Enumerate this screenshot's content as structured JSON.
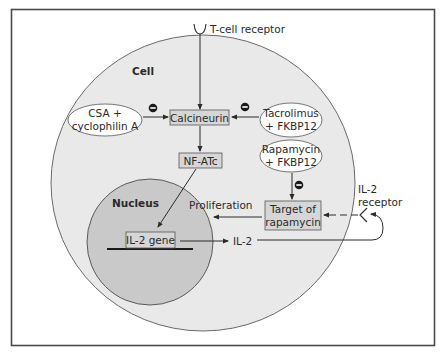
{
  "diagram": {
    "colors": {
      "background": "#ffffff",
      "frame": "#4a4a4a",
      "cell_fill": "#e9e9e9",
      "nucleus_fill": "#c9c9c9",
      "box_fill": "#d6d6d6",
      "ellipse_fill": "#ffffff",
      "line": "#2a2a2a"
    },
    "compartments": {
      "cell_label": "Cell",
      "nucleus_label": "Nucleus"
    },
    "receptors": {
      "tcr_label": "T-cell receptor",
      "il2r_label_line1": "IL-2",
      "il2r_label_line2": "receptor"
    },
    "nodes": {
      "calcineurin": "Calcineurin",
      "nfatc": "NF-ATc",
      "target_line1": "Target of",
      "target_line2": "rapamycin",
      "il2_gene": "IL-2 gene",
      "il2": "IL-2",
      "proliferation": "Proliferation"
    },
    "drugs": {
      "csa_line1": "CSA +",
      "csa_line2": "cyclophilin A",
      "tacro_line1": "Tacrolimus",
      "tacro_line2": "+ FKBP12",
      "rapa_line1": "Rapamycin",
      "rapa_line2": "+ FKBP12"
    },
    "inhibition_symbol": "−",
    "edges": [
      {
        "from": "T-cell receptor",
        "to": "Calcineurin",
        "type": "activation"
      },
      {
        "from": "CSA + cyclophilin A",
        "to": "Calcineurin",
        "type": "inhibition"
      },
      {
        "from": "Tacrolimus + FKBP12",
        "to": "Calcineurin",
        "type": "inhibition"
      },
      {
        "from": "Calcineurin",
        "to": "NF-ATc",
        "type": "activation"
      },
      {
        "from": "NF-ATc",
        "to": "IL-2 gene",
        "type": "activation"
      },
      {
        "from": "IL-2 gene",
        "to": "IL-2",
        "type": "expression"
      },
      {
        "from": "IL-2",
        "to": "IL-2 receptor",
        "type": "binding"
      },
      {
        "from": "IL-2 receptor",
        "to": "Target of rapamycin",
        "type": "activation"
      },
      {
        "from": "Rapamycin + FKBP12",
        "to": "Target of rapamycin",
        "type": "inhibition"
      },
      {
        "from": "Target of rapamycin",
        "to": "Proliferation",
        "type": "activation"
      }
    ]
  }
}
